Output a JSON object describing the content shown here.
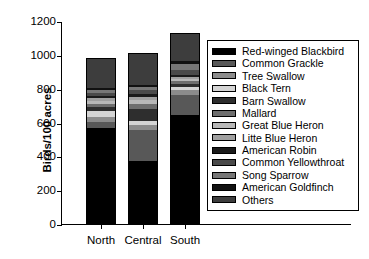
{
  "chart_data": {
    "type": "bar",
    "subtype": "stacked-vertical",
    "title": "",
    "xlabel": "",
    "ylabel": "Birds/100 acres",
    "categories": [
      "North",
      "Central",
      "South"
    ],
    "ylim": [
      0,
      1200
    ],
    "yticks": [
      0,
      200,
      400,
      600,
      800,
      1000,
      1200
    ],
    "ytick_labels": [
      "0",
      "200",
      "400",
      "600",
      "800",
      "1000",
      "1200"
    ],
    "grid": false,
    "legend_position": "right-inside",
    "totals": [
      975,
      1005,
      1125
    ],
    "series": [
      {
        "name": "Red-winged Blackbird",
        "color": "#000000",
        "values": [
          565,
          370,
          645
        ]
      },
      {
        "name": "Common Grackle",
        "color": "#585858",
        "values": [
          40,
          185,
          120
        ]
      },
      {
        "name": "Tree Swallow",
        "color": "#8c8c8c",
        "values": [
          25,
          30,
          25
        ]
      },
      {
        "name": "Black Tern",
        "color": "#d4d4d4",
        "values": [
          38,
          22,
          18
        ]
      },
      {
        "name": "Barn Swallow",
        "color": "#2e2e2e",
        "values": [
          22,
          75,
          20
        ]
      },
      {
        "name": "Mallard",
        "color": "#6e6e6e",
        "values": [
          20,
          28,
          15
        ]
      },
      {
        "name": "Great Blue Heron",
        "color": "#b8b8b8",
        "values": [
          18,
          22,
          12
        ]
      },
      {
        "name": "Litte Blue Heron",
        "color": "#a0a0a0",
        "values": [
          16,
          18,
          12
        ]
      },
      {
        "name": "American Robin",
        "color": "#1a1a1a",
        "values": [
          14,
          20,
          12
        ]
      },
      {
        "name": "Common Yellowthroat",
        "color": "#4a4a4a",
        "values": [
          18,
          22,
          32
        ]
      },
      {
        "name": "Song Sparrow",
        "color": "#777777",
        "values": [
          16,
          18,
          34
        ]
      },
      {
        "name": "American Goldfinch",
        "color": "#111111",
        "values": [
          13,
          15,
          20
        ]
      },
      {
        "name": "Others",
        "color": "#3d3d3d",
        "values": [
          170,
          180,
          160
        ]
      }
    ]
  },
  "legend": {
    "items": [
      "Red-winged Blackbird",
      "Common Grackle",
      "Tree Swallow",
      "Black Tern",
      "Barn Swallow",
      "Mallard",
      "Great Blue Heron",
      "Litte Blue Heron",
      "American Robin",
      "Common Yellowthroat",
      "Song Sparrow",
      "American Goldfinch",
      "Others"
    ]
  }
}
